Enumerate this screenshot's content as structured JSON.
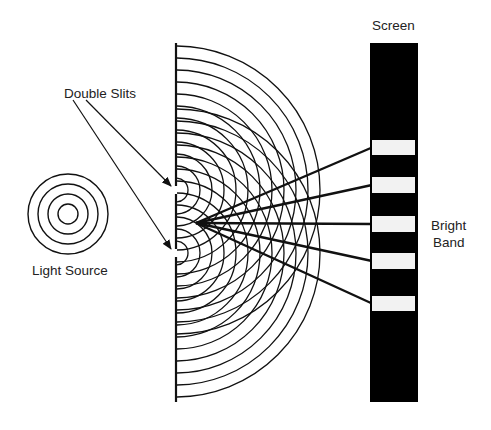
{
  "diagram": {
    "labels": {
      "double_slits": "Double Slits",
      "light_source": "Light Source",
      "screen": "Screen",
      "bright_band_line1": "Bright",
      "bright_band_line2": "Band"
    },
    "colors": {
      "ink": "#111111",
      "screen": "#000000",
      "band": "#f2f2f2",
      "background": "#ffffff"
    },
    "light_source": {
      "cx": 68,
      "cy": 214,
      "radii": [
        10,
        20,
        30,
        40
      ]
    },
    "barrier": {
      "x": 176,
      "y_top": 43,
      "y_bottom": 402
    },
    "slits": [
      {
        "y": 190
      },
      {
        "y": 253
      }
    ],
    "wavefronts": {
      "count": 12,
      "spacing": 12
    },
    "screen": {
      "x": 370,
      "y": 43,
      "width": 48,
      "height": 359
    },
    "bright_bands": [
      {
        "y": 140,
        "height": 15
      },
      {
        "y": 177,
        "height": 16
      },
      {
        "y": 216,
        "height": 16
      },
      {
        "y": 253,
        "height": 16
      },
      {
        "y": 296,
        "height": 15
      }
    ],
    "rays_origin": {
      "x": 196,
      "y": 223
    }
  }
}
